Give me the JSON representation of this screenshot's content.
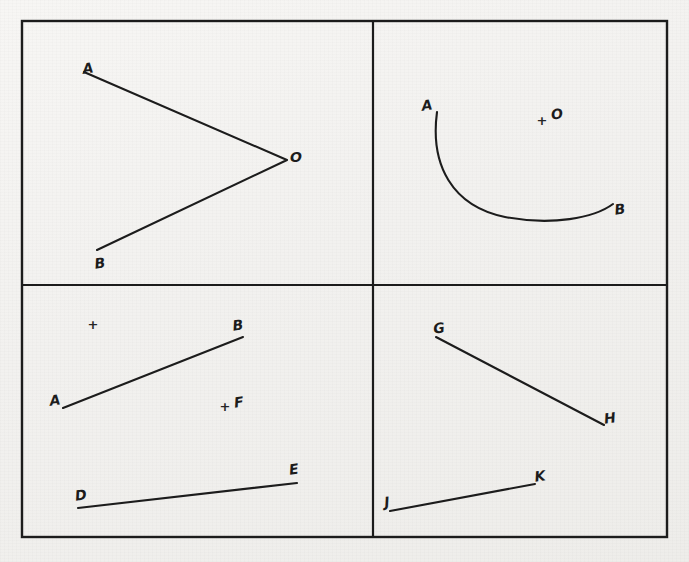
{
  "page": {
    "background_color": "#f4f3f1",
    "ink_color": "#1c1c1c",
    "width": 689,
    "height": 562
  },
  "frame": {
    "name": "outer-border",
    "x": 22,
    "y": 21,
    "width": 645,
    "height": 516,
    "stroke_width": 2.4,
    "divider_vertical_x": 373,
    "divider_horizontal_y": 285
  },
  "quadrants": [
    {
      "id": "top-left",
      "name": "angle-aob",
      "description": "Angle with vertex O formed by two rays to A and B",
      "shapes": [
        {
          "type": "polyline",
          "name": "ray-a-o-b",
          "points": "84,72 287,160 97,250",
          "stroke_width": 2.1
        }
      ],
      "labels": [
        {
          "text": "A",
          "x": 88,
          "y": 68,
          "rotate": -8
        },
        {
          "text": "O",
          "x": 296,
          "y": 157,
          "rotate": 0
        },
        {
          "text": "B",
          "x": 100,
          "y": 263,
          "rotate": -8
        }
      ],
      "plus_marks": []
    },
    {
      "id": "top-right",
      "name": "arc-ab-with-center-o",
      "description": "Circular arc from A to B with a marked center point O",
      "shapes": [
        {
          "type": "path",
          "name": "arc-a-b",
          "d": "M 437 112 C 430 165 452 206 505 217 C 552 226 594 218 613 204",
          "stroke_width": 2.1
        }
      ],
      "labels": [
        {
          "text": "A",
          "x": 427,
          "y": 105,
          "rotate": -8
        },
        {
          "text": "B",
          "x": 620,
          "y": 209,
          "rotate": -8
        },
        {
          "text": "O",
          "x": 557,
          "y": 114,
          "rotate": -8
        }
      ],
      "plus_marks": [
        {
          "name": "center-point-o",
          "x": 542,
          "y": 120
        }
      ]
    },
    {
      "id": "bottom-left",
      "name": "segments-ab-de-with-points",
      "description": "Line segment AB, line segment DE, an unlabeled point and point F",
      "shapes": [
        {
          "type": "line",
          "name": "segment-a-b",
          "x1": 63,
          "y1": 408,
          "x2": 243,
          "y2": 337,
          "stroke_width": 2.1
        },
        {
          "type": "line",
          "name": "segment-d-e",
          "x1": 78,
          "y1": 508,
          "x2": 297,
          "y2": 483,
          "stroke_width": 2.1
        }
      ],
      "labels": [
        {
          "text": "A",
          "x": 55,
          "y": 400,
          "rotate": -8
        },
        {
          "text": "B",
          "x": 238,
          "y": 325,
          "rotate": -8
        },
        {
          "text": "D",
          "x": 81,
          "y": 495,
          "rotate": -8
        },
        {
          "text": "E",
          "x": 294,
          "y": 469,
          "rotate": -8
        },
        {
          "text": "F",
          "x": 239,
          "y": 402,
          "rotate": -8
        }
      ],
      "plus_marks": [
        {
          "name": "unlabeled-point",
          "x": 93,
          "y": 324
        },
        {
          "name": "point-f",
          "x": 225,
          "y": 406
        }
      ]
    },
    {
      "id": "bottom-right",
      "name": "segments-gh-jk",
      "description": "Line segment GH sloping down and line segment JK sloping up",
      "shapes": [
        {
          "type": "line",
          "name": "segment-g-h",
          "x1": 436,
          "y1": 337,
          "x2": 604,
          "y2": 425,
          "stroke_width": 2.1
        },
        {
          "type": "line",
          "name": "segment-j-k",
          "x1": 390,
          "y1": 511,
          "x2": 535,
          "y2": 484,
          "stroke_width": 2.1
        }
      ],
      "labels": [
        {
          "text": "G",
          "x": 439,
          "y": 328,
          "rotate": -8
        },
        {
          "text": "H",
          "x": 610,
          "y": 418,
          "rotate": -8
        },
        {
          "text": "J",
          "x": 387,
          "y": 502,
          "rotate": -8
        },
        {
          "text": "K",
          "x": 540,
          "y": 476,
          "rotate": -8
        }
      ],
      "plus_marks": []
    }
  ]
}
